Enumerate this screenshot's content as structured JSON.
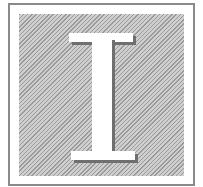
{
  "drop_cap": {
    "letter": "I",
    "colors": {
      "frame_border": "#8a8a8a",
      "background": "#ffffff",
      "hatch_dark": "#9a9a9a",
      "hatch_light": "#cfcfcf",
      "letter_fill": "#ffffff",
      "letter_shadow": "#6f6f6f"
    }
  }
}
